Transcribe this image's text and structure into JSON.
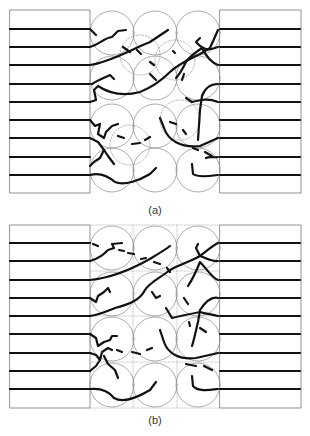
{
  "panels": [
    {
      "id": "a",
      "label": "(a)",
      "arrangement": "random-overlapping-particles"
    },
    {
      "id": "b",
      "label": "(b)",
      "arrangement": "ordered-grid-particles"
    }
  ],
  "colors": {
    "stroke": "#111111",
    "circle": "#888888",
    "box": "#777777",
    "label": "#333333"
  }
}
